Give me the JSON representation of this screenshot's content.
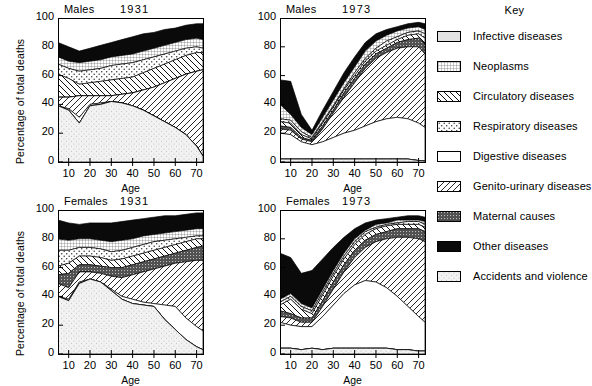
{
  "figure": {
    "ylabel": "Percentage of total deaths",
    "xlabel": "Age",
    "yticks": [
      "0",
      "20",
      "40",
      "60",
      "80",
      "100"
    ],
    "xticks": [
      "10",
      "20",
      "30",
      "40",
      "50",
      "60",
      "70"
    ],
    "ylim": [
      0,
      100
    ],
    "xlim": [
      5,
      73
    ]
  },
  "legend": {
    "title": "Key",
    "items": [
      {
        "label": "Infective diseases",
        "pattern": "light-grey-solid"
      },
      {
        "label": "Neoplasms",
        "pattern": "fine-grid-dots"
      },
      {
        "label": "Circulatory diseases",
        "pattern": "back-hatch-coarse"
      },
      {
        "label": "Respiratory diseases",
        "pattern": "sparse-dots"
      },
      {
        "label": "Digestive diseases",
        "pattern": "white-solid"
      },
      {
        "label": "Genito-urinary diseases",
        "pattern": "fwd-hatch-coarse"
      },
      {
        "label": "Maternal causes",
        "pattern": "dark-grey-stipple"
      },
      {
        "label": "Other diseases",
        "pattern": "black-solid"
      },
      {
        "label": "Accidents and violence",
        "pattern": "very-light-dots"
      }
    ]
  },
  "chart_data": {
    "type": "area",
    "xlabel": "Age",
    "ylabel": "Percentage of total deaths",
    "x": [
      5,
      10,
      15,
      20,
      25,
      30,
      35,
      40,
      45,
      50,
      55,
      60,
      65,
      70,
      73
    ],
    "xlim": [
      5,
      73
    ],
    "ylim": [
      0,
      100
    ],
    "grid": false,
    "legend_position": "right",
    "stack_order": [
      "Accidents and violence",
      "Infective diseases",
      "Digestive diseases",
      "Genito-urinary diseases",
      "Maternal causes",
      "Circulatory diseases",
      "Respiratory diseases",
      "Neoplasms",
      "Other diseases"
    ],
    "panels": [
      {
        "id": "males-1931",
        "sex": "Males",
        "year": "1931",
        "position": "top-left",
        "cumulative_boundaries": [
          {
            "name": "Accidents and violence",
            "values": [
              39,
              36,
              27,
              39,
              40,
              42,
              41,
              39,
              36,
              32,
              28,
              24,
              19,
              11,
              4
            ]
          },
          {
            "name": "Infective diseases",
            "values": [
              39,
              36,
              27,
              39,
              40,
              42,
              41,
              39,
              36,
              32,
              28,
              24,
              19,
              11,
              4
            ]
          },
          {
            "name": "Digestive diseases",
            "values": [
              39,
              37,
              31,
              40,
              41,
              42,
              41,
              39,
              36,
              32,
              28,
              24,
              19,
              11,
              4
            ]
          },
          {
            "name": "Genito-urinary diseases",
            "values": [
              45,
              45,
              46,
              46,
              46,
              46,
              47,
              48,
              50,
              52,
              55,
              58,
              61,
              63,
              64
            ]
          },
          {
            "name": "Maternal causes",
            "values": [
              45,
              45,
              46,
              46,
              46,
              46,
              47,
              48,
              50,
              52,
              55,
              58,
              61,
              63,
              64
            ]
          },
          {
            "name": "Circulatory diseases",
            "values": [
              61,
              58,
              54,
              55,
              56,
              57,
              58,
              59,
              62,
              65,
              68,
              71,
              74,
              76,
              76
            ]
          },
          {
            "name": "Respiratory diseases",
            "values": [
              68,
              65,
              63,
              64,
              65,
              67,
              68,
              69,
              71,
              73,
              75,
              77,
              79,
              80,
              79
            ]
          },
          {
            "name": "Neoplasms",
            "values": [
              73,
              70,
              69,
              70,
              71,
              73,
              74,
              75,
              77,
              79,
              81,
              83,
              85,
              86,
              85
            ]
          },
          {
            "name": "Other diseases",
            "values": [
              83,
              80,
              77,
              79,
              81,
              83,
              85,
              87,
              89,
              90,
              92,
              93,
              95,
              96,
              96
            ]
          }
        ]
      },
      {
        "id": "males-1973",
        "sex": "Males",
        "year": "1973",
        "position": "top-right",
        "cumulative_boundaries": [
          {
            "name": "Accidents and violence",
            "values": [
              2,
              2,
              2,
              2,
              2,
              2,
              2,
              2,
              2,
              2,
              2,
              2,
              2,
              1,
              1
            ]
          },
          {
            "name": "Infective diseases",
            "values": [
              2,
              2,
              2,
              2,
              2,
              2,
              2,
              2,
              2,
              2,
              2,
              2,
              2,
              1,
              1
            ]
          },
          {
            "name": "Digestive diseases",
            "values": [
              20,
              19,
              14,
              12,
              14,
              17,
              20,
              22,
              25,
              28,
              30,
              31,
              30,
              27,
              24
            ]
          },
          {
            "name": "Genito-urinary diseases",
            "values": [
              23,
              22,
              16,
              14,
              23,
              34,
              45,
              55,
              65,
              72,
              76,
              79,
              80,
              80,
              75
            ]
          },
          {
            "name": "Maternal causes",
            "values": [
              25,
              24,
              17,
              15,
              25,
              36,
              48,
              58,
              68,
              75,
              79,
              83,
              85,
              86,
              82
            ]
          },
          {
            "name": "Circulatory diseases",
            "values": [
              28,
              27,
              19,
              16,
              27,
              38,
              50,
              60,
              70,
              77,
              81,
              85,
              88,
              89,
              86
            ]
          },
          {
            "name": "Respiratory diseases",
            "values": [
              30,
              29,
              21,
              17,
              28,
              39,
              51,
              62,
              72,
              79,
              84,
              87,
              90,
              91,
              89
            ]
          },
          {
            "name": "Neoplasms",
            "values": [
              40,
              33,
              24,
              19,
              31,
              43,
              55,
              66,
              77,
              84,
              88,
              91,
              93,
              94,
              92
            ]
          },
          {
            "name": "Other diseases",
            "values": [
              57,
              56,
              33,
              22,
              36,
              49,
              62,
              73,
              83,
              89,
              92,
              94,
              96,
              97,
              96
            ]
          }
        ]
      },
      {
        "id": "females-1931",
        "sex": "Females",
        "year": "1931",
        "position": "bottom-left",
        "cumulative_boundaries": [
          {
            "name": "Accidents and violence",
            "values": [
              40,
              37,
              49,
              52,
              50,
              44,
              38,
              35,
              34,
              33,
              24,
              17,
              10,
              5,
              3
            ]
          },
          {
            "name": "Infective diseases",
            "values": [
              40,
              37,
              49,
              52,
              50,
              44,
              38,
              35,
              34,
              33,
              24,
              17,
              10,
              5,
              3
            ]
          },
          {
            "name": "Digestive diseases",
            "values": [
              40,
              38,
              50,
              52,
              50,
              45,
              40,
              38,
              36,
              35,
              34,
              33,
              25,
              19,
              16
            ]
          },
          {
            "name": "Genito-urinary diseases",
            "values": [
              49,
              46,
              57,
              57,
              56,
              54,
              53,
              55,
              57,
              59,
              61,
              63,
              64,
              65,
              65
            ]
          },
          {
            "name": "Maternal causes",
            "values": [
              55,
              56,
              62,
              62,
              61,
              60,
              60,
              62,
              64,
              66,
              68,
              70,
              72,
              74,
              75
            ]
          },
          {
            "name": "Circulatory diseases",
            "values": [
              61,
              63,
              68,
              68,
              67,
              65,
              66,
              68,
              70,
              72,
              74,
              76,
              78,
              80,
              80
            ]
          },
          {
            "name": "Respiratory diseases",
            "values": [
              72,
              72,
              74,
              74,
              73,
              71,
              72,
              74,
              76,
              78,
              79,
              80,
              81,
              82,
              82
            ]
          },
          {
            "name": "Neoplasms",
            "values": [
              80,
              79,
              80,
              80,
              79,
              78,
              79,
              80,
              82,
              83,
              84,
              85,
              86,
              87,
              87
            ]
          },
          {
            "name": "Other diseases",
            "values": [
              93,
              91,
              90,
              91,
              91,
              91,
              92,
              93,
              94,
              95,
              96,
              96,
              97,
              98,
              98
            ]
          }
        ]
      },
      {
        "id": "females-1973",
        "sex": "Females",
        "year": "1973",
        "position": "bottom-right",
        "cumulative_boundaries": [
          {
            "name": "Accidents and violence",
            "values": [
              4,
              4,
              3,
              4,
              3,
              4,
              4,
              4,
              4,
              4,
              4,
              3,
              3,
              2,
              2
            ]
          },
          {
            "name": "Infective diseases",
            "values": [
              4,
              4,
              3,
              4,
              3,
              4,
              4,
              4,
              4,
              4,
              4,
              3,
              3,
              2,
              2
            ]
          },
          {
            "name": "Digestive diseases",
            "values": [
              22,
              20,
              19,
              19,
              26,
              34,
              42,
              48,
              51,
              50,
              46,
              40,
              33,
              26,
              22
            ]
          },
          {
            "name": "Genito-urinary diseases",
            "values": [
              26,
              25,
              22,
              22,
              33,
              45,
              57,
              67,
              74,
              78,
              80,
              81,
              81,
              80,
              78
            ]
          },
          {
            "name": "Maternal causes",
            "values": [
              30,
              28,
              25,
              25,
              37,
              50,
              62,
              72,
              79,
              83,
              85,
              87,
              87,
              87,
              85
            ]
          },
          {
            "name": "Circulatory diseases",
            "values": [
              34,
              38,
              31,
              28,
              41,
              54,
              66,
              76,
              83,
              87,
              89,
              90,
              90,
              90,
              88
            ]
          },
          {
            "name": "Respiratory diseases",
            "values": [
              36,
              40,
              33,
              30,
              43,
              56,
              68,
              78,
              85,
              88,
              90,
              91,
              92,
              92,
              90
            ]
          },
          {
            "name": "Neoplasms",
            "values": [
              38,
              42,
              35,
              32,
              45,
              58,
              70,
              80,
              86,
              90,
              91,
              93,
              93,
              93,
              92
            ]
          },
          {
            "name": "Other diseases",
            "values": [
              70,
              67,
              56,
              58,
              66,
              74,
              81,
              87,
              91,
              93,
              94,
              95,
              96,
              96,
              95
            ]
          }
        ]
      }
    ]
  }
}
